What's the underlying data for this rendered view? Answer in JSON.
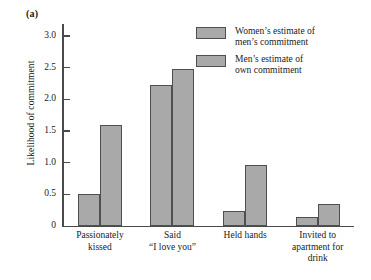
{
  "panel": {
    "label": "(a)"
  },
  "chart_data": {
    "type": "bar",
    "title": "",
    "xlabel": "",
    "ylabel": "Likelihood of commitment",
    "ylim": [
      0,
      3.0
    ],
    "yticks": [
      "0",
      "0.5",
      "1.0",
      "1.5",
      "2.0",
      "2.5",
      "3.0"
    ],
    "ytick_values": [
      0,
      0.5,
      1.0,
      1.5,
      2.0,
      2.5,
      3.0
    ],
    "grid": false,
    "legend_position": "top-right",
    "categories": [
      "Passionately\nkissed",
      "Said\n“I love you”",
      "Held hands",
      "Invited to\napartment for\ndrink"
    ],
    "series": [
      {
        "name": "Women’s estimate of\nmen’s commitment",
        "color": "#a9a9a9",
        "values": [
          0.5,
          2.23,
          0.23,
          0.15
        ]
      },
      {
        "name": "Men’s estimate of\nown commitment",
        "color": "#a9a9a9",
        "values": [
          1.6,
          2.48,
          0.97,
          0.35
        ]
      }
    ]
  },
  "colors": {
    "axis": "#4a4a4a",
    "bar_fill": "#a9a9a9",
    "bar_stroke": "#4f4f4f",
    "text": "#1a1a1a",
    "background": "#ffffff"
  }
}
